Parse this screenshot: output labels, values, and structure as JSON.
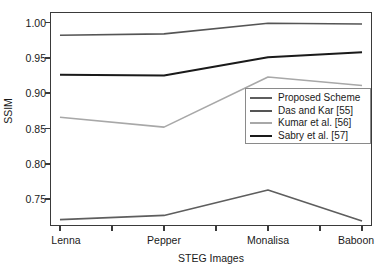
{
  "chart_data": {
    "type": "line",
    "title": "",
    "xlabel": "STEG Images",
    "ylabel": "SSIM",
    "categories": [
      "Lenna",
      "Pepper",
      "Monalisa",
      "Baboon"
    ],
    "yticks": [
      "1.00",
      "0.95",
      "0.90",
      "0.85",
      "0.80",
      "0.75"
    ],
    "ytick_values": [
      1.0,
      0.95,
      0.9,
      0.85,
      0.8,
      0.75
    ],
    "ylim": [
      0.712,
      1.015
    ],
    "xlim": [
      0,
      5
    ],
    "grid": false,
    "legend_position": "center-right",
    "series": [
      {
        "name": "Proposed Scheme",
        "color": "#5e5e5e",
        "width": 1.6,
        "values": [
          0.721,
          0.727,
          0.763,
          0.719
        ]
      },
      {
        "name": "Das and Kar [55]",
        "color": "#555555",
        "width": 1.6,
        "values": [
          0.982,
          0.984,
          0.999,
          0.998
        ]
      },
      {
        "name": "Kumar et al. [56]",
        "color": "#a8a8a8",
        "width": 1.6,
        "values": [
          0.866,
          0.852,
          0.923,
          0.911
        ]
      },
      {
        "name": "Sabry et al. [57]",
        "color": "#1a1a1a",
        "width": 2.0,
        "values": [
          0.926,
          0.925,
          0.951,
          0.958
        ]
      }
    ]
  },
  "legend": {
    "items": [
      {
        "label": "Proposed Scheme",
        "color": "#5e5e5e"
      },
      {
        "label": "Das and Kar [55]",
        "color": "#555555"
      },
      {
        "label": "Kumar et al. [56]",
        "color": "#a8a8a8"
      },
      {
        "label": "Sabry et al. [57]",
        "color": "#1a1a1a"
      }
    ]
  },
  "axes": {
    "y_title": "SSIM",
    "x_title": "STEG Images"
  }
}
